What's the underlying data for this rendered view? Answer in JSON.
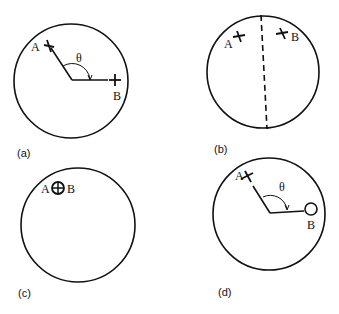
{
  "figure": {
    "panels": [
      {
        "id": "a",
        "caption": "(a)",
        "point_a": "A",
        "point_b": "B",
        "angle": "θ",
        "description": "Two crosses A and B on circle periphery separated by angle θ"
      },
      {
        "id": "b",
        "caption": "(b)",
        "point_a": "A",
        "point_b": "B",
        "description": "Crosses A and B on opposite sides of a dashed dividing line"
      },
      {
        "id": "c",
        "caption": "(c)",
        "point_a": "A",
        "point_b": "B",
        "description": "A and B coincident, shown as circled cross"
      },
      {
        "id": "d",
        "caption": "(d)",
        "point_a": "A",
        "point_b": "B",
        "angle": "θ",
        "description": "Cross A and open circle B separated by angle θ"
      }
    ]
  }
}
